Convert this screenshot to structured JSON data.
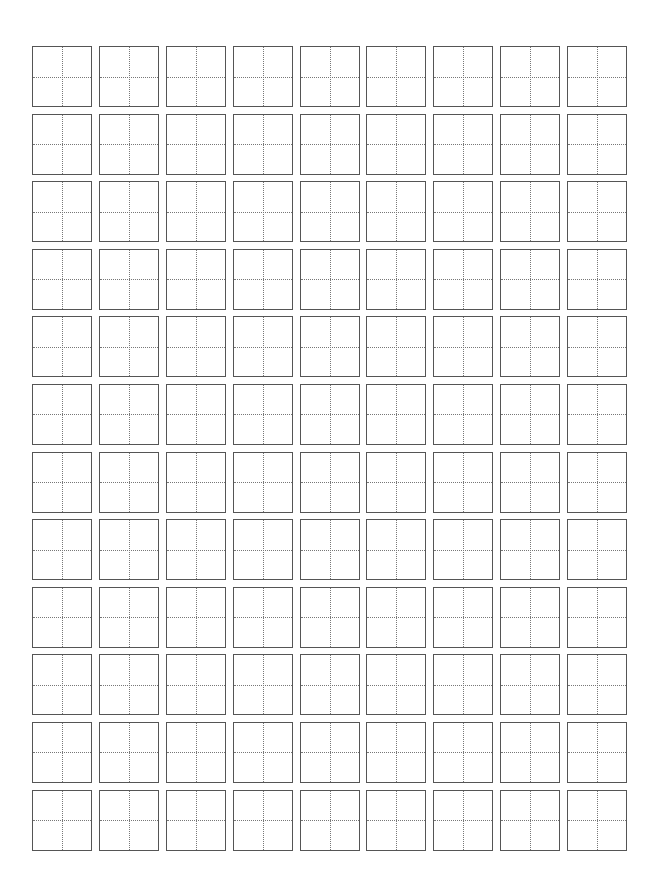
{
  "page": {
    "type": "tianzige-practice-sheet",
    "grid": {
      "columns": 9,
      "rows": 12,
      "cell_count": 108
    },
    "colors": {
      "border": "#555555",
      "guide": "#777777",
      "background": "#ffffff"
    }
  }
}
